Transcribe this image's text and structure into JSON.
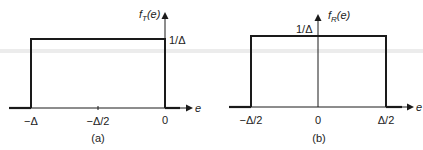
{
  "panels": [
    {
      "id": "a",
      "caption": "(a)",
      "y_label_f": "f",
      "y_label_sub": "T",
      "y_label_arg": "(e)",
      "x_axis_label": "e",
      "height_label": "1/Δ",
      "x_ticks": [
        "−Δ",
        "−Δ/2",
        "0"
      ]
    },
    {
      "id": "b",
      "caption": "(b)",
      "y_label_f": "f",
      "y_label_sub": "R",
      "y_label_arg": "(e)",
      "x_axis_label": "e",
      "height_label": "1/Δ",
      "x_ticks": [
        "−Δ/2",
        "0",
        "Δ/2"
      ]
    }
  ],
  "colors": {
    "line": "#1a1a1a",
    "text": "#222222",
    "band": "#e6e6e6"
  }
}
